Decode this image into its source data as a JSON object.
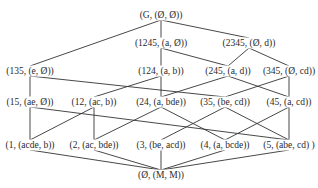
{
  "diagram": {
    "type": "concept-lattice",
    "line_color": "#333333",
    "nodes": [
      {
        "id": "top",
        "label": "(G, (Ø, Ø))",
        "x": 161,
        "y": 15
      },
      {
        "id": "n1245",
        "label": "(1245, (a, Ø))",
        "x": 161,
        "y": 43
      },
      {
        "id": "n2345",
        "label": "(2345, (Ø, d))",
        "x": 249,
        "y": 43
      },
      {
        "id": "n135",
        "label": "(135, (e, Ø))",
        "x": 30,
        "y": 71
      },
      {
        "id": "n124",
        "label": "(124, (a, b))",
        "x": 161,
        "y": 71
      },
      {
        "id": "n245",
        "label": "(245, (a, d))",
        "x": 228,
        "y": 71
      },
      {
        "id": "n345",
        "label": "(345, (Ø, cd))",
        "x": 289,
        "y": 71
      },
      {
        "id": "n15",
        "label": "(15, (ae, Ø))",
        "x": 30,
        "y": 102
      },
      {
        "id": "n12",
        "label": "(12, (ac, b))",
        "x": 94,
        "y": 102
      },
      {
        "id": "n24",
        "label": "(24, (a, bde))",
        "x": 161,
        "y": 102
      },
      {
        "id": "n35",
        "label": "(35, (be, cd))",
        "x": 225,
        "y": 102
      },
      {
        "id": "n45",
        "label": "(45, (a, cd))",
        "x": 289,
        "y": 102
      },
      {
        "id": "n1",
        "label": "(1, (acde, b))",
        "x": 30,
        "y": 145
      },
      {
        "id": "n2",
        "label": "(2, (ac, bde))",
        "x": 94,
        "y": 145
      },
      {
        "id": "n3",
        "label": "(3, (be, acd))",
        "x": 161,
        "y": 145
      },
      {
        "id": "n4",
        "label": "(4, (a, bcde))",
        "x": 225,
        "y": 145
      },
      {
        "id": "n5",
        "label": "(5, (abe, cd) )",
        "x": 289,
        "y": 145
      },
      {
        "id": "bot",
        "label": "(Ø, (M, M))",
        "x": 161,
        "y": 175
      }
    ],
    "edges": [
      [
        "top",
        "n1245"
      ],
      [
        "top",
        "n2345"
      ],
      [
        "top",
        "n135"
      ],
      [
        "n1245",
        "n124"
      ],
      [
        "n1245",
        "n245"
      ],
      [
        "n2345",
        "n245"
      ],
      [
        "n2345",
        "n345"
      ],
      [
        "n135",
        "n15"
      ],
      [
        "n135",
        "n35"
      ],
      [
        "n124",
        "n12"
      ],
      [
        "n124",
        "n24"
      ],
      [
        "n245",
        "n24"
      ],
      [
        "n245",
        "n45"
      ],
      [
        "n345",
        "n35"
      ],
      [
        "n345",
        "n45"
      ],
      [
        "n15",
        "n1"
      ],
      [
        "n15",
        "n5"
      ],
      [
        "n12",
        "n1"
      ],
      [
        "n12",
        "n2"
      ],
      [
        "n24",
        "n2"
      ],
      [
        "n24",
        "n4"
      ],
      [
        "n35",
        "n3"
      ],
      [
        "n35",
        "n5"
      ],
      [
        "n45",
        "n4"
      ],
      [
        "n45",
        "n5"
      ],
      [
        "n1",
        "bot"
      ],
      [
        "n2",
        "bot"
      ],
      [
        "n3",
        "bot"
      ],
      [
        "n4",
        "bot"
      ],
      [
        "n5",
        "bot"
      ]
    ]
  }
}
